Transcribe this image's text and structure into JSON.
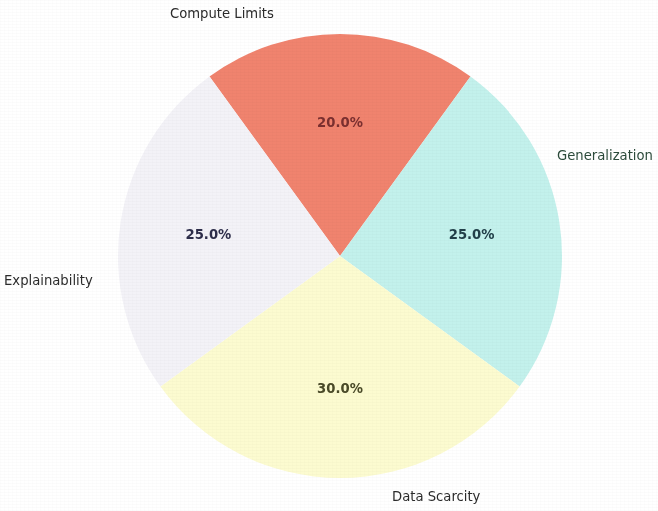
{
  "chart_data": {
    "type": "pie",
    "title": "",
    "categories": [
      "Compute Limits",
      "Generalization",
      "Data Scarcity",
      "Explainability"
    ],
    "values": [
      20.0,
      25.0,
      30.0,
      25.0
    ],
    "value_labels": [
      "20.0%",
      "25.0%",
      "30.0%",
      "25.0%"
    ],
    "colors": [
      "#f0836e",
      "#f3f2f7",
      "#fcfbd0",
      "#c3f1ec"
    ],
    "autopct_format": "%.1f%%",
    "start_angle_deg": 54,
    "direction": "counterclockwise",
    "legend": "none",
    "grid": false,
    "slices": [
      {
        "label": "Compute Limits",
        "value": 20.0,
        "value_label": "20.0%",
        "color": "#f0836e",
        "pct_text_color": "#7a2f2f",
        "label_text_color": "#2b2b2b"
      },
      {
        "label": "Generalization",
        "value": 25.0,
        "value_label": "25.0%",
        "color": "#f3f2f7",
        "pct_text_color": "#2d2d4a",
        "label_text_color": "#2b4a3a"
      },
      {
        "label": "Data Scarcity",
        "value": 30.0,
        "value_label": "30.0%",
        "color": "#fcfbd0",
        "pct_text_color": "#4a4a28",
        "label_text_color": "#2b2b2b"
      },
      {
        "label": "Explainability",
        "value": 25.0,
        "value_label": "25.0%",
        "color": "#c3f1ec",
        "pct_text_color": "#22404a",
        "label_text_color": "#2b2b2b"
      }
    ]
  },
  "figure": {
    "background_color": "#ffffff",
    "center_x": 340,
    "center_y": 256,
    "radius": 222
  }
}
